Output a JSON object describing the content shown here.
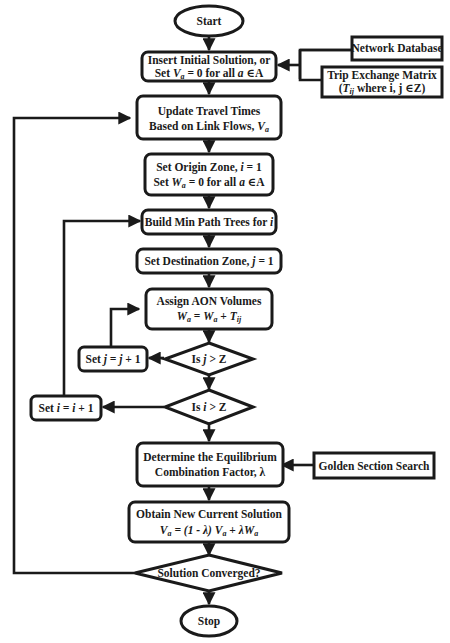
{
  "diagram": {
    "type": "flowchart",
    "nodes": {
      "start": {
        "shape": "ellipse",
        "label": "Start"
      },
      "insert_initial": {
        "shape": "rounded-rect",
        "line1": "Insert Initial Solution, or",
        "line2_pre": "Set ",
        "line2_var": "V",
        "line2_sub": "a",
        "line2_mid": " = 0 for all ",
        "line2_var2": "a",
        "line2_post": " ∈A"
      },
      "network_db": {
        "shape": "rect",
        "label": "Network Database"
      },
      "trip_matrix": {
        "shape": "rect",
        "line1": "Trip Exchange Matrix",
        "line2_pre": "(",
        "line2_var": "T",
        "line2_sub": "ij",
        "line2_post": " where i, j ∈Z)"
      },
      "update_times": {
        "shape": "rounded-rect",
        "line1": "Update Travel Times",
        "line2_pre": "Based on Link Flows, ",
        "line2_var": "V",
        "line2_sub": "a"
      },
      "set_origin": {
        "shape": "rounded-rect",
        "line1_pre": "Set Origin Zone, ",
        "line1_var": "i",
        "line1_post": " = 1",
        "line2_pre": "Set ",
        "line2_var": "W",
        "line2_sub": "a",
        "line2_mid": " = 0 for all ",
        "line2_var2": "a",
        "line2_post": " ∈A"
      },
      "build_trees": {
        "shape": "rounded-rect",
        "label_pre": "Build Min Path Trees for ",
        "label_var": "i"
      },
      "set_dest": {
        "shape": "rounded-rect",
        "label_pre": "Set Destination Zone, ",
        "label_var": "j",
        "label_post": " = 1"
      },
      "assign_aon": {
        "shape": "rounded-rect",
        "line1": "Assign AON Volumes",
        "line2": "Wa = Wa + Tij"
      },
      "is_j_gt_z": {
        "shape": "diamond",
        "label_pre": "Is ",
        "label_var": "j",
        "label_post": " > Z"
      },
      "set_j": {
        "shape": "rounded-rect",
        "label_pre": "Set ",
        "label_var": "j = j",
        "label_post": " + 1"
      },
      "is_i_gt_z": {
        "shape": "diamond",
        "label_pre": "Is ",
        "label_var": "i",
        "label_post": " > Z"
      },
      "set_i": {
        "shape": "rounded-rect",
        "label_pre": "Set ",
        "label_var": "i = i",
        "label_post": " + 1"
      },
      "determine_lambda": {
        "shape": "rounded-rect",
        "line1": "Determine the Equilibrium",
        "line2": "Combination Factor, λ"
      },
      "golden_section": {
        "shape": "rect",
        "label": "Golden Section Search"
      },
      "obtain_new": {
        "shape": "rounded-rect",
        "line1": "Obtain New Current Solution",
        "line2": "Va = (1 - λ) Va + λWa"
      },
      "converged": {
        "shape": "diamond",
        "label": "Solution Converged?"
      },
      "stop": {
        "shape": "ellipse",
        "label": "Stop"
      }
    },
    "edges": [
      [
        "start",
        "insert_initial"
      ],
      [
        "network_db",
        "insert_initial"
      ],
      [
        "trip_matrix",
        "insert_initial"
      ],
      [
        "insert_initial",
        "update_times"
      ],
      [
        "update_times",
        "set_origin"
      ],
      [
        "set_origin",
        "build_trees"
      ],
      [
        "build_trees",
        "set_dest"
      ],
      [
        "set_dest",
        "assign_aon"
      ],
      [
        "assign_aon",
        "is_j_gt_z"
      ],
      [
        "is_j_gt_z",
        "set_j"
      ],
      [
        "set_j",
        "assign_aon"
      ],
      [
        "is_j_gt_z",
        "is_i_gt_z"
      ],
      [
        "is_i_gt_z",
        "set_i"
      ],
      [
        "set_i",
        "build_trees"
      ],
      [
        "is_i_gt_z",
        "determine_lambda"
      ],
      [
        "golden_section",
        "determine_lambda"
      ],
      [
        "determine_lambda",
        "obtain_new"
      ],
      [
        "obtain_new",
        "converged"
      ],
      [
        "converged",
        "update_times"
      ],
      [
        "converged",
        "stop"
      ]
    ],
    "colors": {
      "stroke": "#1a1a1a",
      "fill": "#ffffff",
      "background": "#ffffff"
    }
  }
}
